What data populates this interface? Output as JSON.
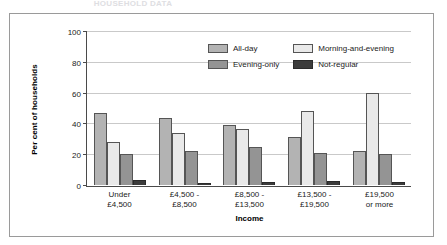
{
  "figure": {
    "cropped_title": "HOUSEHOLD DATA",
    "frame_border_color": "#9a9a9a",
    "background": "#ffffff"
  },
  "chart_data": {
    "type": "bar",
    "title": "",
    "subtitle": "",
    "xlabel": "Income",
    "ylabel": "Per cent of households",
    "ylim": [
      0,
      100
    ],
    "yticks": [
      0,
      20,
      40,
      60,
      80,
      100
    ],
    "ytick_labels": [
      "0",
      "20",
      "40",
      "60",
      "80",
      "100"
    ],
    "grid": true,
    "grid_axis": "y",
    "legend_position": "inside-top-right",
    "categories": [
      "Under £4,500",
      "£4,500 - £8,500",
      "£8,500 - £13,500",
      "£13,500 - £19,500",
      "£19,500 or more"
    ],
    "category_lines": [
      [
        "Under",
        "£4,500"
      ],
      [
        "£4,500 -",
        "£8,500"
      ],
      [
        "£8,500 -",
        "£13,500"
      ],
      [
        "£13,500 -",
        "£19,500"
      ],
      [
        "£19,500",
        "or more"
      ]
    ],
    "series": [
      {
        "name": "All-day",
        "color": "#b3b3b3",
        "values": [
          47,
          43.5,
          39.5,
          31.5,
          22.5
        ]
      },
      {
        "name": "Morning-and-evening",
        "color": "#e9e9e9",
        "values": [
          28,
          34,
          36.5,
          48.5,
          60
        ]
      },
      {
        "name": "Evening-only",
        "color": "#949494",
        "values": [
          20.5,
          22.5,
          25,
          21,
          20
        ]
      },
      {
        "name": "Not-regular",
        "color": "#3b3b3b",
        "values": [
          3,
          1.5,
          2,
          2.5,
          2
        ]
      }
    ]
  }
}
